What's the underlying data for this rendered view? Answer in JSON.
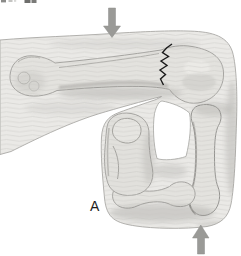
{
  "figure": {
    "panel_label": "A",
    "illustration": "lateral view of flexed elbow with supracondylar humerus fracture",
    "fracture": {
      "present": true,
      "color": "#1b1b1b"
    },
    "arrows": [
      {
        "name": "downward-force-arrow",
        "direction": "down",
        "color": "#9a9a97"
      },
      {
        "name": "upward-force-arrow",
        "direction": "up",
        "color": "#9a9a97"
      }
    ],
    "colors": {
      "background": "#ffffff",
      "soft_tissue": "#eae9e6",
      "bone": "#e3e2de",
      "outline": "#a3a29f"
    }
  }
}
